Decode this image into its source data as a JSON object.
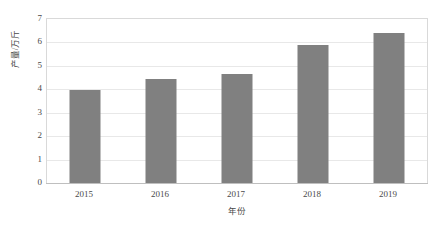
{
  "chart_data": {
    "type": "bar",
    "title": "",
    "subtitle": "",
    "categories": [
      "2015",
      "2016",
      "2017",
      "2018",
      "2019"
    ],
    "values": [
      3.95,
      4.45,
      4.65,
      5.9,
      6.4
    ],
    "series": [
      {
        "name": "产量",
        "values": [
          3.95,
          4.45,
          4.65,
          5.9,
          6.4
        ]
      }
    ],
    "xlabel": "年份",
    "ylabel": "产量/万斤",
    "ylim": [
      0,
      7
    ],
    "ytick_step": 1,
    "yticks": [
      "0",
      "1",
      "2",
      "3",
      "4",
      "5",
      "6",
      "7"
    ],
    "xticks": [
      "2015",
      "2016",
      "2017",
      "2018",
      "2019"
    ],
    "grid": true,
    "grid_axis": "y",
    "legend": false,
    "legend_position": "none",
    "annotations": [],
    "colors": {
      "bar": "#808080",
      "gridline": "#e8e8e8",
      "plot_border": "#d9d9d9",
      "axis_line": "#bfbfbf",
      "text": "#4a4a4a",
      "background": "#ffffff"
    }
  }
}
